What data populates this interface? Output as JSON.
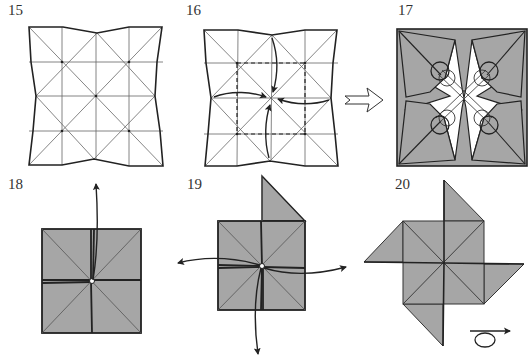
{
  "colors": {
    "paper_colored": "#a6a6a6",
    "paper_white": "#ffffff",
    "line": "#222222",
    "thin_line": "#555555"
  },
  "steps": [
    {
      "number": "15",
      "label_pos": [
        8,
        2
      ],
      "description": "Pre-creased square with pinched edge midpoints"
    },
    {
      "number": "16",
      "label_pos": [
        186,
        2
      ],
      "description": "Collapse along dashed square; push four edge midpoints to center"
    },
    {
      "number": "17",
      "label_pos": [
        398,
        2
      ],
      "description": "Collapsed star form; circles mark points to flatten"
    },
    {
      "number": "18",
      "label_pos": [
        8,
        176
      ],
      "description": "Small square; pull flap upward"
    },
    {
      "number": "19",
      "label_pos": [
        187,
        176
      ],
      "description": "One flap raised; pull remaining three flaps out"
    },
    {
      "number": "20",
      "label_pos": [
        395,
        176
      ],
      "description": "Pinwheel complete; turn over"
    }
  ],
  "symbols": {
    "next_arrow": "hollow-right-arrow",
    "turn_over": "turn-over-symbol"
  }
}
